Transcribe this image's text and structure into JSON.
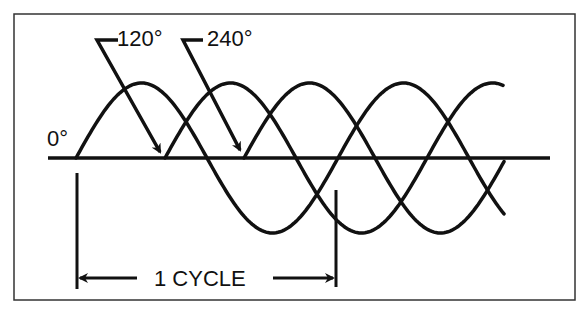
{
  "diagram": {
    "labels": {
      "zero": "0°",
      "phase2": "120°",
      "phase3": "240°",
      "cycle": "1 CYCLE"
    },
    "colors": {
      "ink": "#111111",
      "background": "#ffffff",
      "frame": "#333333"
    },
    "waves": [
      {
        "name": "phase-0",
        "start_x": 76,
        "end_x": 505
      },
      {
        "name": "phase-120",
        "start_x": 165,
        "end_x": 503
      },
      {
        "name": "phase-240",
        "start_x": 244,
        "end_x": 505
      }
    ],
    "axis": {
      "y": 158,
      "x_start": 48,
      "x_end": 550
    },
    "period_px": 262,
    "amplitude_px": 75
  }
}
